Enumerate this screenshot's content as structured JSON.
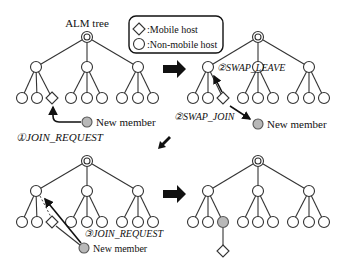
{
  "title": "ALM tree",
  "legend": {
    "mobile_label": ":Mobile host",
    "nonmobile_label": ":Non-mobile host"
  },
  "panels": [
    {
      "id": "step1",
      "new_member_label": "New member",
      "message_label": "①JOIN_REQUEST"
    },
    {
      "id": "step2",
      "new_member_label": "New member",
      "swap_leave_label": "②SWAP_LEAVE",
      "swap_join_label": "②SWAP_JOIN"
    },
    {
      "id": "step3",
      "new_member_label": "New member",
      "message_label": "③JOIN_REQUEST"
    },
    {
      "id": "step4"
    }
  ],
  "colors": {
    "node_fill": "#ffffff",
    "new_member_fill": "#b8b8b8",
    "stroke": "#333333",
    "arrow": "#111111"
  }
}
